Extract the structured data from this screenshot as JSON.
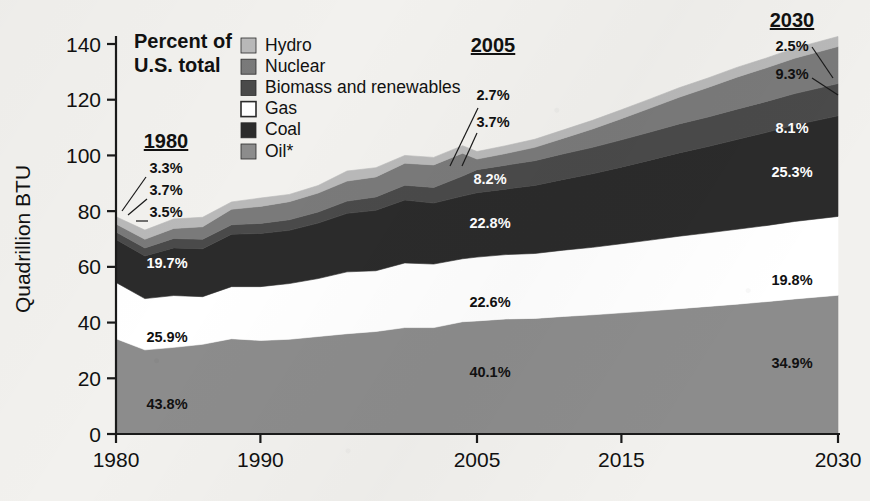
{
  "header": {
    "note_line1": "Percent of",
    "note_line2": "U.S. total"
  },
  "axes": {
    "ylabel": "Quadrillion BTU",
    "yticks": [
      "0",
      "20",
      "40",
      "60",
      "80",
      "100",
      "120",
      "140"
    ],
    "xticks": [
      "1980",
      "1990",
      "2005",
      "2015",
      "2030"
    ],
    "ylim": [
      0,
      140
    ],
    "xlim": [
      1980,
      2030
    ]
  },
  "legend": {
    "position": "top-center",
    "items": [
      {
        "label": "Hydro",
        "color": "#b9b9b9"
      },
      {
        "label": "Nuclear",
        "color": "#7a7a7a"
      },
      {
        "label": "Biomass and renewables",
        "color": "#4a4a4a"
      },
      {
        "label": "Gas",
        "color": "#ffffff"
      },
      {
        "label": "Coal",
        "color": "#2b2b2b"
      },
      {
        "label": "Oil*",
        "color": "#8c8c8c"
      }
    ]
  },
  "annotations": {
    "groups": [
      {
        "year": "1980",
        "values": [
          {
            "series": "Hydro",
            "text": "3.3%",
            "style": "dark"
          },
          {
            "series": "Nuclear",
            "text": "3.7%",
            "style": "dark"
          },
          {
            "series": "Biomass and renewables",
            "text": "3.5%",
            "style": "dark"
          },
          {
            "series": "Coal",
            "text": "19.7%",
            "style": "light"
          },
          {
            "series": "Gas",
            "text": "25.9%",
            "style": "dark"
          },
          {
            "series": "Oil*",
            "text": "43.8%",
            "style": "dark"
          }
        ]
      },
      {
        "year": "2005",
        "values": [
          {
            "series": "Hydro",
            "text": "2.7%",
            "style": "dark"
          },
          {
            "series": "Nuclear",
            "text": "3.7%",
            "style": "dark"
          },
          {
            "series": "Biomass and renewables",
            "text": "8.2%",
            "style": "light"
          },
          {
            "series": "Coal",
            "text": "22.8%",
            "style": "light"
          },
          {
            "series": "Gas",
            "text": "22.6%",
            "style": "dark"
          },
          {
            "series": "Oil*",
            "text": "40.1%",
            "style": "dark"
          }
        ]
      },
      {
        "year": "2030",
        "values": [
          {
            "series": "Hydro",
            "text": "2.5%",
            "style": "dark"
          },
          {
            "series": "Nuclear",
            "text": "9.3%",
            "style": "dark"
          },
          {
            "series": "Biomass and renewables",
            "text": "8.1%",
            "style": "light"
          },
          {
            "series": "Coal",
            "text": "25.3%",
            "style": "light"
          },
          {
            "series": "Gas",
            "text": "19.8%",
            "style": "dark"
          },
          {
            "series": "Oil*",
            "text": "34.9%",
            "style": "dark"
          }
        ]
      }
    ]
  },
  "chart_data": {
    "type": "area",
    "title": "",
    "subtitle": "",
    "xlabel": "",
    "ylabel": "Quadrillion BTU",
    "xlim": [
      1980,
      2030
    ],
    "ylim": [
      0,
      140
    ],
    "grid": false,
    "stacked": true,
    "stack_order_bottom_to_top": [
      "Oil*",
      "Gas",
      "Coal",
      "Biomass and renewables",
      "Nuclear",
      "Hydro"
    ],
    "x": [
      1980,
      1982,
      1984,
      1986,
      1988,
      1990,
      1992,
      1994,
      1996,
      1998,
      2000,
      2002,
      2004,
      2005,
      2007,
      2009,
      2011,
      2013,
      2015,
      2017,
      2019,
      2021,
      2023,
      2025,
      2027,
      2030
    ],
    "series": [
      {
        "name": "Oil*",
        "color": "#8c8c8c",
        "values": [
          34.2,
          30.2,
          31.1,
          32.2,
          34.2,
          33.6,
          34.0,
          35.0,
          36.0,
          36.8,
          38.2,
          38.2,
          40.3,
          40.6,
          41.3,
          41.5,
          42.2,
          42.8,
          43.5,
          44.2,
          45.0,
          45.8,
          46.6,
          47.5,
          48.5,
          49.8
        ]
      },
      {
        "name": "Gas",
        "color": "#ffffff",
        "values": [
          20.2,
          18.4,
          18.6,
          17.1,
          18.7,
          19.3,
          20.0,
          20.8,
          22.2,
          21.8,
          23.2,
          22.8,
          22.6,
          22.9,
          23.1,
          23.3,
          23.8,
          24.2,
          24.8,
          25.4,
          26.0,
          26.4,
          26.9,
          27.3,
          27.8,
          28.3
        ]
      },
      {
        "name": "Coal",
        "color": "#2b2b2b",
        "values": [
          15.4,
          15.3,
          17.1,
          17.2,
          18.8,
          19.1,
          19.1,
          19.9,
          21.0,
          21.7,
          22.6,
          21.9,
          22.5,
          23.1,
          23.5,
          24.4,
          25.4,
          26.4,
          27.5,
          28.7,
          29.9,
          31.0,
          32.2,
          33.4,
          34.6,
          36.1
        ]
      },
      {
        "name": "Biomass and renewables",
        "color": "#4a4a4a",
        "values": [
          2.7,
          2.9,
          3.4,
          3.4,
          3.4,
          3.6,
          3.8,
          4.0,
          4.4,
          4.8,
          5.3,
          5.6,
          7.2,
          8.3,
          8.6,
          8.9,
          9.2,
          9.5,
          9.8,
          10.1,
          10.4,
          10.6,
          10.9,
          11.1,
          11.3,
          11.6
        ]
      },
      {
        "name": "Nuclear",
        "color": "#7a7a7a",
        "values": [
          2.9,
          3.1,
          3.6,
          4.5,
          5.6,
          6.1,
          6.5,
          6.8,
          7.2,
          7.2,
          7.9,
          8.1,
          8.2,
          3.8,
          4.2,
          4.8,
          5.6,
          6.6,
          7.6,
          8.6,
          9.6,
          10.6,
          11.5,
          12.1,
          12.7,
          13.3
        ]
      },
      {
        "name": "Hydro",
        "color": "#b9b9b9",
        "values": [
          2.6,
          3.3,
          3.4,
          3.4,
          2.6,
          3.0,
          2.6,
          2.7,
          3.6,
          3.3,
          2.8,
          2.7,
          2.7,
          2.7,
          2.8,
          2.9,
          3.0,
          3.1,
          3.2,
          3.3,
          3.4,
          3.4,
          3.5,
          3.5,
          3.6,
          3.6
        ]
      }
    ]
  }
}
